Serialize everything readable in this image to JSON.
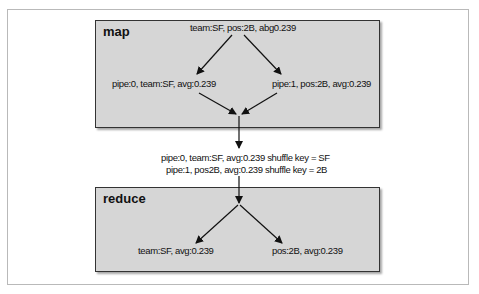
{
  "diagram": {
    "map": {
      "title": "map",
      "input": "team:SF, pos:2B, abg0.239",
      "left_output": "pipe:0, team:SF, avg:0.239",
      "right_output": "pipe:1, pos:2B, avg:0.239"
    },
    "shuffle": {
      "line1": "pipe:0, team:SF, avg:0.239 shuffle key = SF",
      "line2": "pipe:1, pos2B, avg:0.239 shuffle key = 2B"
    },
    "reduce": {
      "title": "reduce",
      "left_output": "team:SF, avg:0.239",
      "right_output": "pos:2B, avg:0.239"
    },
    "colors": {
      "stage_fill": "#d6d6d6",
      "stage_border": "#333333",
      "frame_border": "#b9b9b9",
      "arrow": "#111111"
    }
  }
}
